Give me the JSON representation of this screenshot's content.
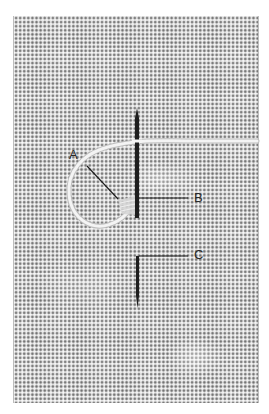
{
  "figure": {
    "labels": {
      "a": "A",
      "b": "B",
      "c": "C"
    },
    "colors": {
      "fabric": "#e9e9e9",
      "weave_dot": "#7a7a7a",
      "thread": "#f2f2f2",
      "needle": "#1e1e1e",
      "leader_line": "#1a1a1a",
      "label_text": "#2a2a2a",
      "background": "#ffffff"
    }
  }
}
